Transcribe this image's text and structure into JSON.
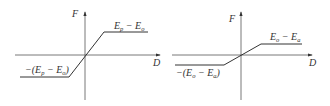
{
  "diagrams": [
    {
      "name": "passive",
      "y_axis_label": "F",
      "x_axis_label": "D",
      "upper_label": {
        "E": "E",
        "sub1": "p",
        "minus": " − ",
        "E2": "E",
        "sub2": "o"
      },
      "lower_label": {
        "prefix": "−(",
        "E": "E",
        "sub1": "p",
        "minus": " − ",
        "E2": "E",
        "sub2": "o",
        "suffix": ")"
      }
    },
    {
      "name": "active",
      "y_axis_label": "F",
      "x_axis_label": "D",
      "upper_label": {
        "E": "E",
        "sub1": "o",
        "minus": " − ",
        "E2": "E",
        "sub2": "a"
      },
      "lower_label": {
        "prefix": "−(",
        "E": "E",
        "sub1": "o",
        "minus": " − ",
        "E2": "E",
        "sub2": "a",
        "suffix": ")"
      }
    }
  ],
  "colors": {
    "line": "#333333",
    "axis": "#555555"
  }
}
